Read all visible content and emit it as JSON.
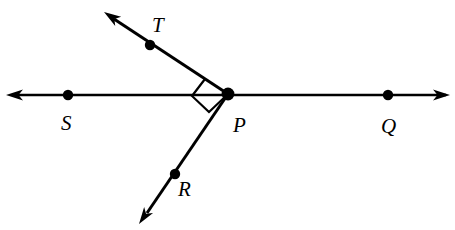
{
  "figure": {
    "kind": "geometry-diagram",
    "background_color": "#ffffff",
    "ink_color": "#000000",
    "canvas": {
      "width": 455,
      "height": 230
    }
  },
  "labels": {
    "t": "T",
    "s": "S",
    "p": "P",
    "q": "Q",
    "r": "R"
  },
  "label_positions": {
    "t": {
      "x": 152,
      "y": 32
    },
    "s": {
      "x": 61,
      "y": 130
    },
    "p": {
      "x": 233,
      "y": 132
    },
    "q": {
      "x": 381,
      "y": 133
    },
    "r": {
      "x": 178,
      "y": 196
    }
  },
  "points": [
    {
      "name": "S",
      "label": "S",
      "x": 68,
      "y": 95,
      "radius": 5.2
    },
    {
      "name": "P",
      "label": "P",
      "x": 228,
      "y": 94,
      "radius": 6.4
    },
    {
      "name": "Q",
      "label": "Q",
      "x": 388,
      "y": 95,
      "radius": 5.2
    },
    {
      "name": "T",
      "label": "T",
      "x": 150,
      "y": 45,
      "radius": 5.2
    },
    {
      "name": "R",
      "label": "R",
      "x": 175,
      "y": 174,
      "radius": 5.2
    }
  ],
  "lines": [
    {
      "name": "line-SQ",
      "kind": "double-arrow-line",
      "from": {
        "x": 12,
        "y": 95
      },
      "to": {
        "x": 446,
        "y": 95
      },
      "stroke_width": 2.6,
      "arrow_start": {
        "x": 6,
        "y": 95
      },
      "arrow_end": {
        "x": 450,
        "y": 95
      }
    },
    {
      "name": "ray-PT",
      "kind": "single-arrow-ray",
      "from": {
        "x": 228,
        "y": 94
      },
      "to": {
        "x": 114,
        "y": 19
      },
      "stroke_width": 3.0,
      "arrow_end": {
        "x": 104,
        "y": 12
      }
    },
    {
      "name": "ray-PR",
      "kind": "single-arrow-ray",
      "from": {
        "x": 228,
        "y": 94
      },
      "to": {
        "x": 147,
        "y": 213
      },
      "stroke_width": 3.0,
      "arrow_end": {
        "x": 139,
        "y": 224
      }
    }
  ],
  "angle_marker": {
    "name": "right-angle-TPR",
    "measure_degrees": 90,
    "vertex": {
      "x": 228,
      "y": 94
    },
    "stroke_width": 2.2,
    "path_points": [
      {
        "x": 205,
        "y": 79
      },
      {
        "x": 192,
        "y": 96
      },
      {
        "x": 209,
        "y": 112
      },
      {
        "x": 228,
        "y": 94
      }
    ]
  },
  "arrow_geometry": {
    "head_length": 17,
    "head_half_width": 5.4,
    "head_notch": 4.5
  }
}
